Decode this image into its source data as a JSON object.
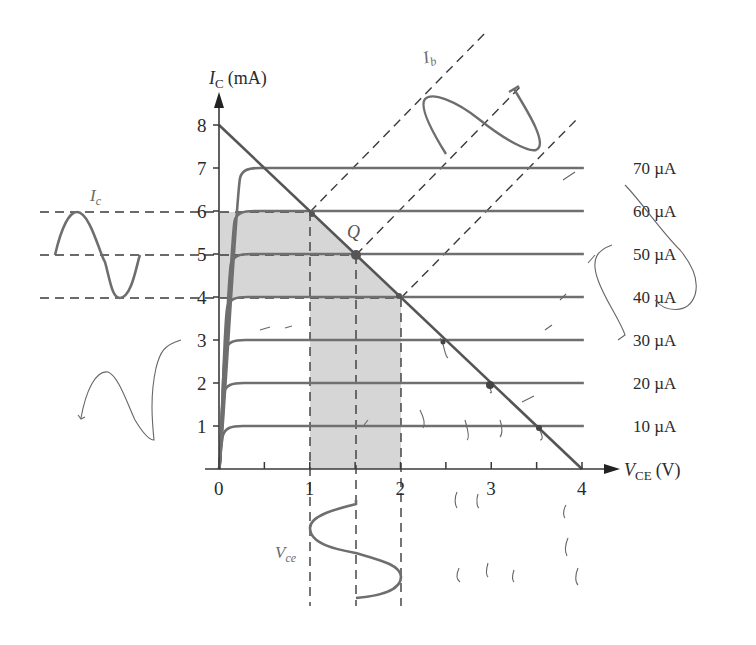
{
  "figure": {
    "y_axis": {
      "symbol": "I",
      "subscript": "C",
      "unit": "(mA)",
      "ticks": [
        "1",
        "2",
        "3",
        "4",
        "5",
        "6",
        "7",
        "8"
      ]
    },
    "x_axis": {
      "symbol": "V",
      "subscript": "CE",
      "unit": "(V)",
      "ticks": [
        "0",
        "1",
        "2",
        "3",
        "4"
      ]
    },
    "curve_labels": [
      "10 µA",
      "20 µA",
      "30 µA",
      "40 µA",
      "50 µA",
      "60 µA",
      "70 µA"
    ],
    "q_point_label": "Q",
    "wave_labels": {
      "ic": "I",
      "ic_sub": "c",
      "ib": "I",
      "ib_sub": "b",
      "vce": "V",
      "vce_sub": "ce"
    },
    "colors": {
      "axis": "#3a3a3a",
      "curve": "#707070",
      "shade": "#d4d4d4",
      "dash": "#3a3a3a",
      "wave": "#6e6e6e",
      "scribble": "#555555"
    }
  },
  "chart_data": {
    "type": "line",
    "xlabel": "V_CE (V)",
    "ylabel": "I_C (mA)",
    "xlim": [
      0,
      4
    ],
    "ylim": [
      0,
      8
    ],
    "grid": false,
    "series": [
      {
        "name": "I_B = 10 µA",
        "ic_sat_mA": 1
      },
      {
        "name": "I_B = 20 µA",
        "ic_sat_mA": 2
      },
      {
        "name": "I_B = 30 µA",
        "ic_sat_mA": 3
      },
      {
        "name": "I_B = 40 µA",
        "ic_sat_mA": 4
      },
      {
        "name": "I_B = 50 µA",
        "ic_sat_mA": 5
      },
      {
        "name": "I_B = 60 µA",
        "ic_sat_mA": 6
      },
      {
        "name": "I_B = 70 µA",
        "ic_sat_mA": 7
      }
    ],
    "load_line": {
      "x": [
        0,
        4
      ],
      "y": [
        8,
        0
      ]
    },
    "q_point": {
      "vce": 1.5,
      "ic": 5,
      "ib_uA": 50
    },
    "swing": {
      "ic_min": 4,
      "ic_max": 6,
      "vce_min": 1,
      "vce_max": 2,
      "ib_min_uA": 40,
      "ib_max_uA": 60
    },
    "annotations": [
      "Q",
      "I_c",
      "I_b",
      "V_ce"
    ]
  }
}
